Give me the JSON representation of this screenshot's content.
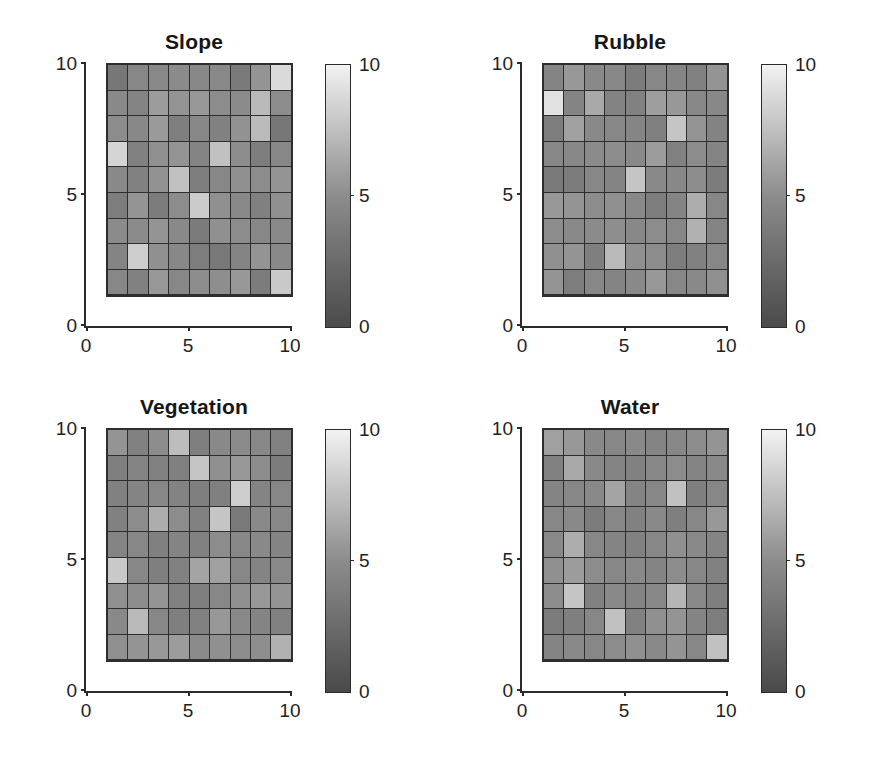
{
  "figure": {
    "background_color": "#ffffff",
    "layout": "2x2 subplot grid",
    "colormap": "grayscale (dark = low, light = high)"
  },
  "axis": {
    "xticks": [
      "0",
      "5",
      "10"
    ],
    "yticks": [
      "0",
      "5",
      "10"
    ],
    "xtick_values": [
      0,
      5,
      10
    ],
    "ytick_values": [
      0,
      5,
      10
    ],
    "xlim": [
      0,
      10
    ],
    "ylim": [
      0,
      10
    ]
  },
  "colorbar": {
    "ticks": [
      "0",
      "5",
      "10"
    ],
    "tick_values": [
      0,
      5,
      10
    ],
    "limits": [
      0,
      10
    ],
    "low_color": "#4a4a4a",
    "mid_color": "#8c8c8c",
    "high_color": "#f2f2f2"
  },
  "panels": [
    {
      "id": "slope",
      "title": "Slope"
    },
    {
      "id": "rubble",
      "title": "Rubble"
    },
    {
      "id": "vegetation",
      "title": "Vegetation"
    },
    {
      "id": "water",
      "title": "Water"
    }
  ],
  "chart_data": [
    {
      "type": "heatmap",
      "title": "Slope",
      "xlabel": "",
      "ylabel": "",
      "xlim": [
        0,
        10
      ],
      "ylim": [
        0,
        10
      ],
      "grid": false,
      "cell_extent": {
        "x": [
          1,
          10
        ],
        "y": [
          1,
          10
        ]
      },
      "rows": 9,
      "cols": 9,
      "colorbar": {
        "label": "",
        "limits": [
          0,
          10
        ],
        "ticks": [
          0,
          5,
          10
        ]
      },
      "values": [
        [
          3.4,
          4.6,
          4.8,
          4.9,
          4.7,
          4.8,
          3.6,
          5.4,
          8.8
        ],
        [
          4.8,
          4.4,
          5.8,
          5.4,
          5.6,
          5.0,
          4.9,
          7.2,
          5.0
        ],
        [
          5.0,
          4.7,
          5.7,
          4.0,
          4.6,
          4.2,
          5.3,
          7.3,
          3.4
        ],
        [
          8.6,
          4.2,
          5.2,
          5.4,
          4.4,
          7.6,
          5.0,
          3.9,
          4.6
        ],
        [
          4.8,
          4.2,
          5.3,
          7.6,
          3.9,
          4.6,
          5.2,
          5.0,
          5.4
        ],
        [
          3.9,
          5.4,
          3.8,
          5.0,
          8.1,
          5.2,
          4.8,
          4.1,
          5.2
        ],
        [
          4.9,
          4.9,
          5.4,
          4.8,
          3.7,
          5.2,
          5.0,
          4.6,
          4.8
        ],
        [
          4.4,
          8.2,
          5.2,
          4.7,
          3.9,
          3.5,
          4.4,
          5.4,
          4.8
        ],
        [
          4.6,
          4.2,
          5.6,
          4.6,
          5.0,
          5.1,
          5.6,
          3.8,
          8.0
        ]
      ]
    },
    {
      "type": "heatmap",
      "title": "Rubble",
      "xlabel": "",
      "ylabel": "",
      "xlim": [
        0,
        10
      ],
      "ylim": [
        0,
        10
      ],
      "grid": false,
      "cell_extent": {
        "x": [
          1,
          10
        ],
        "y": [
          1,
          10
        ]
      },
      "rows": 9,
      "cols": 9,
      "colorbar": {
        "label": "",
        "limits": [
          0,
          10
        ],
        "ticks": [
          0,
          5,
          10
        ]
      },
      "values": [
        [
          4.4,
          5.6,
          4.8,
          4.7,
          3.8,
          4.6,
          4.5,
          4.2,
          5.4
        ],
        [
          9.2,
          4.4,
          6.4,
          4.3,
          4.2,
          5.9,
          5.6,
          4.6,
          4.7
        ],
        [
          3.9,
          6.0,
          4.8,
          4.6,
          4.5,
          4.1,
          7.8,
          5.4,
          4.3
        ],
        [
          4.6,
          4.7,
          4.9,
          5.0,
          4.8,
          5.8,
          4.2,
          5.0,
          4.4
        ],
        [
          3.6,
          3.8,
          4.6,
          4.4,
          7.8,
          4.8,
          4.7,
          5.0,
          3.8
        ],
        [
          5.6,
          5.4,
          5.0,
          5.2,
          4.8,
          3.9,
          4.4,
          6.6,
          4.6
        ],
        [
          5.0,
          4.8,
          4.9,
          5.1,
          4.7,
          5.0,
          4.6,
          6.8,
          4.4
        ],
        [
          5.2,
          5.4,
          4.0,
          7.2,
          5.2,
          5.0,
          3.9,
          4.2,
          4.6
        ],
        [
          5.4,
          3.9,
          4.6,
          4.4,
          4.8,
          5.6,
          4.6,
          4.8,
          5.2
        ]
      ]
    },
    {
      "type": "heatmap",
      "title": "Vegetation",
      "xlabel": "",
      "ylabel": "",
      "xlim": [
        0,
        10
      ],
      "ylim": [
        0,
        10
      ],
      "grid": false,
      "cell_extent": {
        "x": [
          1,
          10
        ],
        "y": [
          1,
          10
        ]
      },
      "rows": 9,
      "cols": 9,
      "colorbar": {
        "label": "",
        "limits": [
          0,
          10
        ],
        "ticks": [
          0,
          5,
          10
        ]
      },
      "values": [
        [
          5.4,
          4.2,
          5.0,
          7.4,
          4.0,
          4.8,
          4.9,
          4.7,
          4.2
        ],
        [
          4.0,
          4.4,
          4.2,
          4.1,
          7.8,
          5.2,
          5.6,
          5.0,
          3.8
        ],
        [
          4.2,
          4.4,
          4.6,
          4.3,
          4.0,
          4.1,
          8.2,
          4.4,
          4.6
        ],
        [
          4.2,
          5.0,
          6.6,
          5.0,
          4.2,
          7.8,
          3.6,
          4.8,
          4.7
        ],
        [
          4.4,
          4.6,
          4.1,
          4.4,
          4.2,
          5.0,
          4.6,
          4.8,
          4.4
        ],
        [
          8.0,
          4.6,
          4.0,
          4.2,
          6.2,
          6.0,
          4.6,
          4.4,
          4.8
        ],
        [
          5.2,
          5.0,
          5.4,
          4.2,
          4.0,
          4.6,
          5.2,
          5.6,
          5.4
        ],
        [
          4.8,
          7.2,
          4.6,
          4.0,
          4.2,
          5.6,
          4.8,
          4.4,
          4.2
        ],
        [
          5.2,
          5.4,
          5.6,
          5.8,
          4.9,
          5.2,
          5.0,
          5.1,
          6.8
        ]
      ]
    },
    {
      "type": "heatmap",
      "title": "Water",
      "xlabel": "",
      "ylabel": "",
      "xlim": [
        0,
        10
      ],
      "ylim": [
        0,
        10
      ],
      "grid": false,
      "cell_extent": {
        "x": [
          1,
          10
        ],
        "y": [
          1,
          10
        ]
      },
      "rows": 9,
      "cols": 9,
      "colorbar": {
        "label": "",
        "limits": [
          0,
          10
        ],
        "ticks": [
          0,
          5,
          10
        ]
      },
      "values": [
        [
          6.0,
          5.6,
          4.8,
          4.6,
          4.8,
          4.4,
          4.6,
          5.0,
          5.4
        ],
        [
          4.2,
          6.4,
          4.8,
          4.4,
          4.2,
          4.6,
          5.0,
          4.4,
          4.8
        ],
        [
          4.4,
          4.6,
          4.8,
          6.2,
          4.4,
          4.6,
          7.6,
          4.0,
          4.6
        ],
        [
          4.6,
          4.8,
          3.8,
          4.6,
          4.2,
          4.8,
          4.0,
          4.6,
          5.6
        ],
        [
          4.8,
          6.6,
          4.6,
          4.4,
          4.2,
          4.6,
          5.2,
          4.8,
          4.4
        ],
        [
          5.2,
          5.8,
          5.0,
          4.6,
          4.8,
          4.4,
          5.0,
          4.6,
          4.2
        ],
        [
          5.0,
          7.8,
          4.2,
          4.8,
          4.4,
          4.6,
          7.0,
          4.8,
          4.0
        ],
        [
          3.8,
          4.0,
          4.6,
          7.6,
          4.2,
          5.2,
          5.4,
          4.4,
          3.9
        ],
        [
          4.4,
          4.8,
          4.6,
          5.0,
          5.2,
          4.8,
          5.4,
          4.6,
          7.6
        ]
      ]
    }
  ]
}
